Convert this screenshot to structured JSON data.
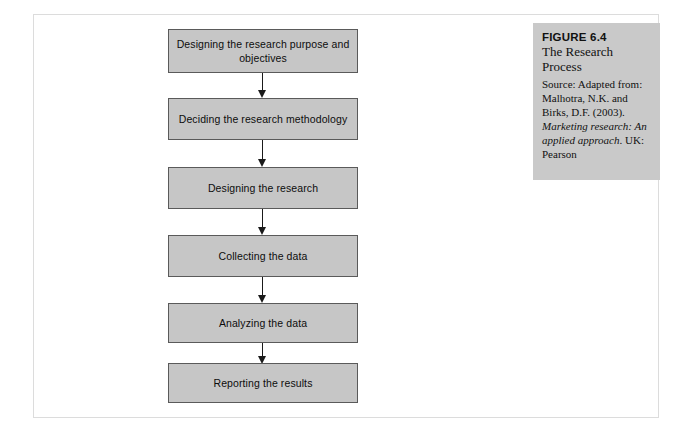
{
  "figure": {
    "number_label": "FIGURE 6.4",
    "title": "The Research Process",
    "source_prefix": "Source: Adapted from: Malhotra, N.K. and Birks, D.F. (2003).",
    "source_publication": "Marketing research: An applied approach",
    "source_suffix": ". UK: Pearson"
  },
  "flowchart": {
    "steps": [
      {
        "label": "Designing the research purpose and objectives"
      },
      {
        "label": "Deciding the research methodology"
      },
      {
        "label": "Designing the research"
      },
      {
        "label": "Collecting the data"
      },
      {
        "label": "Analyzing the data"
      },
      {
        "label": "Reporting the results"
      }
    ]
  },
  "colors": {
    "box_fill": "#c6c6c6",
    "box_border": "#5a5a5a",
    "panel_fill": "#c9c9c9",
    "arrow": "#1a1a1a",
    "page_border": "#dcdcdc"
  }
}
